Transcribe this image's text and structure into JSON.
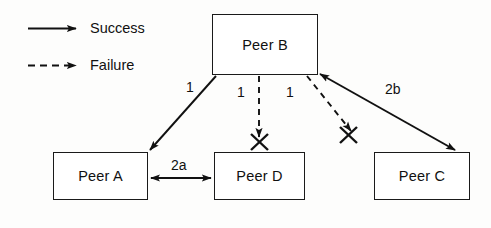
{
  "diagram": {
    "ink_color": "#111111",
    "background_color": "#fdfdfc",
    "legend": {
      "items": [
        {
          "key": "success",
          "label": "Success",
          "line_style": "solid",
          "icon": "solid-arrow-icon"
        },
        {
          "key": "failure",
          "label": "Failure",
          "line_style": "dashed",
          "icon": "dashed-arrow-icon"
        }
      ]
    },
    "nodes": [
      {
        "id": "peer-b",
        "label": "Peer B",
        "x": 212,
        "y": 14,
        "w": 106,
        "h": 61
      },
      {
        "id": "peer-a",
        "label": "Peer A",
        "x": 53,
        "y": 152,
        "w": 95,
        "h": 48
      },
      {
        "id": "peer-d",
        "label": "Peer D",
        "x": 214,
        "y": 152,
        "w": 91,
        "h": 48
      },
      {
        "id": "peer-c",
        "label": "Peer C",
        "x": 374,
        "y": 152,
        "w": 96,
        "h": 48
      }
    ],
    "edges": [
      {
        "id": "b-to-a",
        "from": "peer-b",
        "to": "peer-a",
        "label": "1",
        "label_x": 186,
        "label_y": 80,
        "type": "success",
        "line_style": "solid",
        "arrows": "end",
        "blocked": false
      },
      {
        "id": "b-to-d",
        "from": "peer-b",
        "to": "peer-d",
        "label": "1",
        "label_x": 237,
        "label_y": 85,
        "type": "failure",
        "line_style": "dashed",
        "arrows": "end",
        "blocked": true
      },
      {
        "id": "b-to-c",
        "from": "peer-b",
        "to": "peer-c",
        "label": "1",
        "label_x": 286,
        "label_y": 85,
        "type": "failure",
        "line_style": "dashed",
        "arrows": "end",
        "blocked": true
      },
      {
        "id": "a-to-d",
        "from": "peer-a",
        "to": "peer-d",
        "label": "2a",
        "label_x": 171,
        "label_y": 158,
        "type": "success",
        "line_style": "solid",
        "arrows": "both",
        "blocked": false
      },
      {
        "id": "c-to-b",
        "from": "peer-c",
        "to": "peer-b",
        "label": "2b",
        "label_x": 385,
        "label_y": 82,
        "type": "success",
        "line_style": "solid",
        "arrows": "both",
        "blocked": false
      }
    ],
    "failure_marks": [
      {
        "id": "x-mark-peer-d",
        "x": 259,
        "y": 141
      },
      {
        "id": "x-mark-peer-c",
        "x": 348,
        "y": 134
      }
    ]
  }
}
